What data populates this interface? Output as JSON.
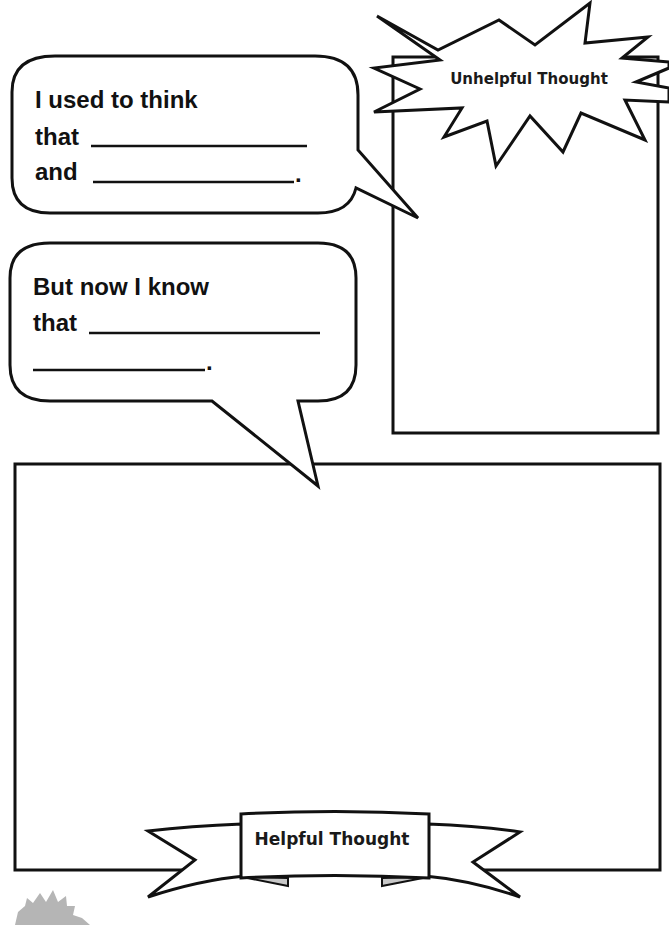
{
  "worksheet": {
    "bubble_past": {
      "line1": "I used to think",
      "line2": "that",
      "line3": "and",
      "end_punct": "."
    },
    "bubble_now": {
      "line1": "But now I know",
      "line2": "that",
      "end_punct": "."
    },
    "unhelpful_box": {
      "label": "Unhelpful Thought"
    },
    "helpful_box": {
      "label": "Helpful Thought"
    },
    "colors": {
      "ink": "#111111",
      "paper": "#ffffff",
      "ribbon_shade": "#c8c8c8",
      "corner_mark": "#b5b5b5"
    }
  }
}
